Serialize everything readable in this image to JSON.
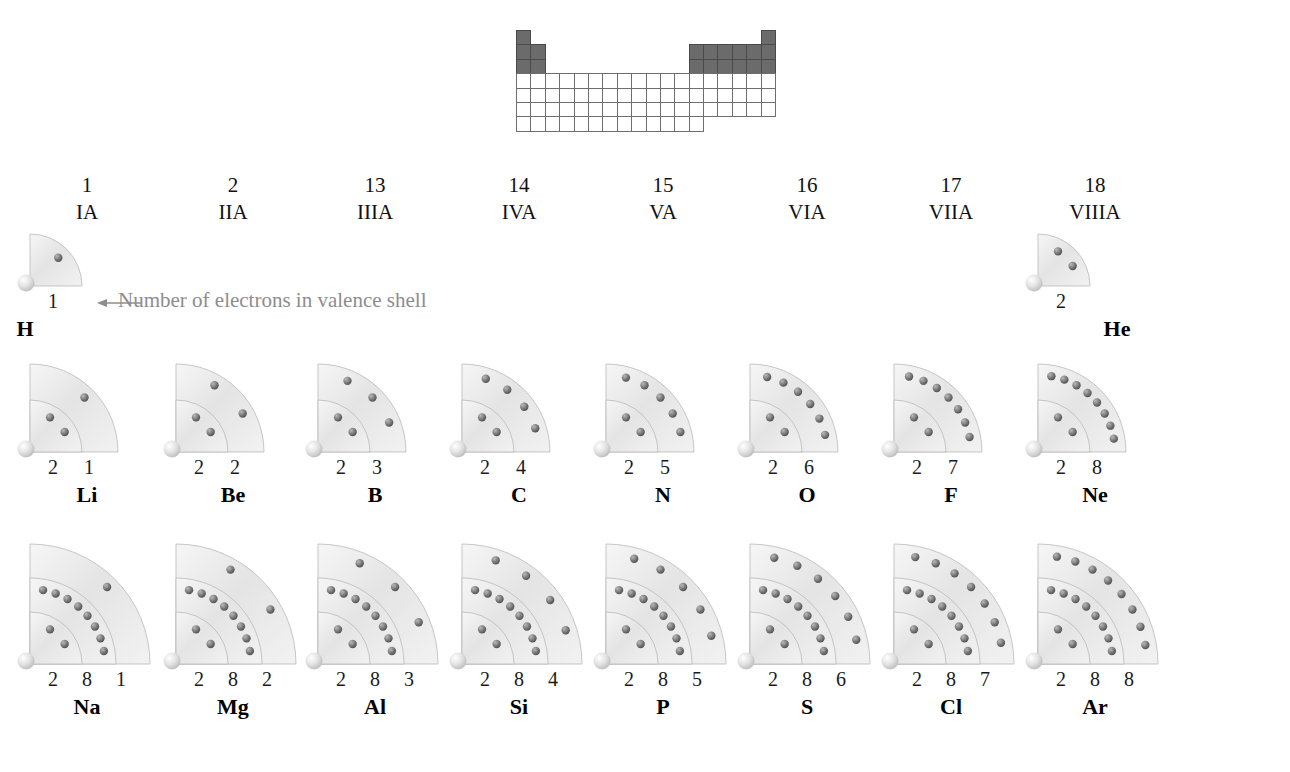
{
  "diagram": {
    "annotation": {
      "text": "Number of electrons in valence shell",
      "color": "#8d8d8d",
      "points_to": "H"
    },
    "colors": {
      "shell_fill": "#e9e9e9",
      "shell_edge": "#b9b9b9",
      "electron": "#6f6f6f",
      "nucleus": "#dcdcdc",
      "highlight": "#6b6b6b",
      "grid_line": "#6e6e6e",
      "text": "#111111"
    }
  },
  "mini_table": {
    "name": "periodic-table-locator",
    "columns": 18,
    "rows": 7,
    "highlighted_note": "Main group columns 1, 2 and 13-18 of periods 1-3 are shaded",
    "row_cells": [
      [
        1,
        0,
        0,
        0,
        0,
        0,
        0,
        0,
        0,
        0,
        0,
        0,
        0,
        0,
        0,
        0,
        0,
        1
      ],
      [
        1,
        1,
        0,
        0,
        0,
        0,
        0,
        0,
        0,
        0,
        0,
        0,
        1,
        1,
        1,
        1,
        1,
        1
      ],
      [
        1,
        1,
        0,
        0,
        0,
        0,
        0,
        0,
        0,
        0,
        0,
        0,
        1,
        1,
        1,
        1,
        1,
        1
      ],
      [
        2,
        2,
        2,
        2,
        2,
        2,
        2,
        2,
        2,
        2,
        2,
        2,
        2,
        2,
        2,
        2,
        2,
        2
      ],
      [
        2,
        2,
        2,
        2,
        2,
        2,
        2,
        2,
        2,
        2,
        2,
        2,
        2,
        2,
        2,
        2,
        2,
        2
      ],
      [
        2,
        2,
        2,
        2,
        2,
        2,
        2,
        2,
        2,
        2,
        2,
        2,
        2,
        2,
        2,
        2,
        2,
        2
      ],
      [
        2,
        2,
        2,
        2,
        2,
        2,
        2,
        2,
        2,
        2,
        2,
        2,
        2,
        0,
        0,
        0,
        0,
        0
      ]
    ]
  },
  "groups": [
    {
      "number": "1",
      "roman": "IA"
    },
    {
      "number": "2",
      "roman": "IIA"
    },
    {
      "number": "13",
      "roman": "IIIA"
    },
    {
      "number": "14",
      "roman": "IVA"
    },
    {
      "number": "15",
      "roman": "VA"
    },
    {
      "number": "16",
      "roman": "VIA"
    },
    {
      "number": "17",
      "roman": "VIIA"
    },
    {
      "number": "18",
      "roman": "VIIIA"
    }
  ],
  "elements": [
    {
      "symbol": "H",
      "group": 1,
      "period": 1,
      "shells": [
        1
      ]
    },
    {
      "symbol": "He",
      "group": 18,
      "period": 1,
      "shells": [
        2
      ]
    },
    {
      "symbol": "Li",
      "group": 1,
      "period": 2,
      "shells": [
        2,
        1
      ]
    },
    {
      "symbol": "Be",
      "group": 2,
      "period": 2,
      "shells": [
        2,
        2
      ]
    },
    {
      "symbol": "B",
      "group": 13,
      "period": 2,
      "shells": [
        2,
        3
      ]
    },
    {
      "symbol": "C",
      "group": 14,
      "period": 2,
      "shells": [
        2,
        4
      ]
    },
    {
      "symbol": "N",
      "group": 15,
      "period": 2,
      "shells": [
        2,
        5
      ]
    },
    {
      "symbol": "O",
      "group": 16,
      "period": 2,
      "shells": [
        2,
        6
      ]
    },
    {
      "symbol": "F",
      "group": 17,
      "period": 2,
      "shells": [
        2,
        7
      ]
    },
    {
      "symbol": "Ne",
      "group": 18,
      "period": 2,
      "shells": [
        2,
        8
      ]
    },
    {
      "symbol": "Na",
      "group": 1,
      "period": 3,
      "shells": [
        2,
        8,
        1
      ]
    },
    {
      "symbol": "Mg",
      "group": 2,
      "period": 3,
      "shells": [
        2,
        8,
        2
      ]
    },
    {
      "symbol": "Al",
      "group": 13,
      "period": 3,
      "shells": [
        2,
        8,
        3
      ]
    },
    {
      "symbol": "Si",
      "group": 14,
      "period": 3,
      "shells": [
        2,
        8,
        4
      ]
    },
    {
      "symbol": "P",
      "group": 15,
      "period": 3,
      "shells": [
        2,
        8,
        5
      ]
    },
    {
      "symbol": "S",
      "group": 16,
      "period": 3,
      "shells": [
        2,
        8,
        6
      ]
    },
    {
      "symbol": "Cl",
      "group": 17,
      "period": 3,
      "shells": [
        2,
        8,
        7
      ]
    },
    {
      "symbol": "Ar",
      "group": 18,
      "period": 3,
      "shells": [
        2,
        8,
        8
      ]
    }
  ]
}
